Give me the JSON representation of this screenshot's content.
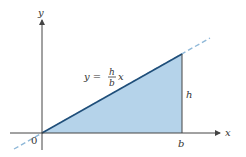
{
  "diagram": {
    "type": "triangle-under-line",
    "axes": {
      "x_label": "x",
      "y_label": "y",
      "origin_label": "0"
    },
    "line": {
      "equation_lhs": "y =",
      "fraction_numerator": "h",
      "fraction_denominator": "b",
      "equation_var": "x",
      "style": "dashed extension"
    },
    "labels": {
      "base_point": "b",
      "height": "h"
    },
    "colors": {
      "fill": "#b5d3ea",
      "line": "#1f4e79",
      "dash": "#8fb8d8",
      "axis": "#444444"
    }
  }
}
